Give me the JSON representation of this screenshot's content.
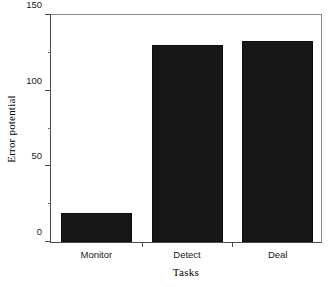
{
  "chart_data": {
    "type": "bar",
    "title": "",
    "categories": [
      "Monitor",
      "Detect",
      "Deal"
    ],
    "values": [
      19,
      130,
      133
    ],
    "xlabel": "Tasks",
    "ylabel": "Error potential",
    "ylim": [
      0,
      150
    ],
    "yticks": [
      0,
      50,
      100,
      150
    ],
    "ytick_labels": [
      "0",
      "50",
      "100",
      "150"
    ],
    "yminor_ticks": [
      25,
      75,
      125
    ],
    "grid": false,
    "legend": false,
    "bar_color": "#171717",
    "axis_color": "#4a4a4a",
    "background": "#ffffff"
  }
}
